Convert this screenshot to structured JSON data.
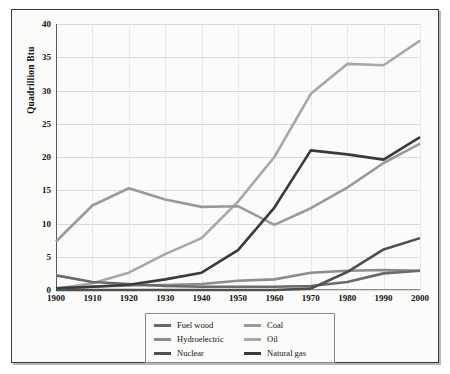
{
  "chart_data": {
    "type": "line",
    "title": "",
    "xlabel": "",
    "ylabel": "Quadrillion Btu",
    "categories": [
      1900,
      1910,
      1920,
      1930,
      1940,
      1950,
      1960,
      1970,
      1980,
      1990,
      2000
    ],
    "x_tick_labels": [
      "1900",
      "1910",
      "1920",
      "1930",
      "1940",
      "1950",
      "1960",
      "1970",
      "1980",
      "1990",
      "2000"
    ],
    "y_tick_labels": [
      "0",
      "5",
      "10",
      "15",
      "20",
      "25",
      "30",
      "35",
      "40"
    ],
    "y_ticks": [
      0,
      5,
      10,
      15,
      20,
      25,
      30,
      35,
      40
    ],
    "ylim": [
      0,
      40
    ],
    "xlim": [
      1900,
      2000
    ],
    "grid": true,
    "legend_position": "below-center",
    "series": [
      {
        "name": "Fuel wood",
        "color": "#6a6a6a",
        "values": [
          2.2,
          1.2,
          0.9,
          0.6,
          0.5,
          0.5,
          0.5,
          0.6,
          1.2,
          2.5,
          2.9
        ]
      },
      {
        "name": "Hydroelectric",
        "color": "#8c8c8c",
        "values": [
          0.25,
          0.5,
          0.7,
          0.75,
          0.9,
          1.4,
          1.6,
          2.6,
          2.9,
          3.0,
          2.9
        ]
      },
      {
        "name": "Nuclear",
        "color": "#4f4f4f",
        "values": [
          0,
          0,
          0,
          0,
          0,
          0,
          0,
          0.2,
          2.7,
          6.1,
          7.8
        ]
      },
      {
        "name": "Coal",
        "color": "#9a9a9a",
        "values": [
          7.3,
          12.7,
          15.3,
          13.6,
          12.5,
          12.6,
          9.8,
          12.3,
          15.4,
          19.1,
          22.0
        ]
      },
      {
        "name": "Oil",
        "color": "#a8a8a8",
        "values": [
          0.2,
          1.0,
          2.6,
          5.4,
          7.8,
          13.3,
          20.0,
          29.5,
          34.0,
          33.8,
          37.5
        ]
      },
      {
        "name": "Natural gas",
        "color": "#3a3a3a",
        "values": [
          0.25,
          0.5,
          0.8,
          1.6,
          2.6,
          6.0,
          12.4,
          21.0,
          20.4,
          19.6,
          23.0
        ]
      }
    ]
  },
  "legend": {
    "columns": [
      [
        {
          "label": "Fuel wood",
          "color": "#6a6a6a"
        },
        {
          "label": "Hydroelectric",
          "color": "#8c8c8c"
        },
        {
          "label": "Nuclear",
          "color": "#4f4f4f"
        }
      ],
      [
        {
          "label": "Coal",
          "color": "#9a9a9a"
        },
        {
          "label": "Oil",
          "color": "#a8a8a8"
        },
        {
          "label": "Natural gas",
          "color": "#3a3a3a"
        }
      ]
    ]
  }
}
